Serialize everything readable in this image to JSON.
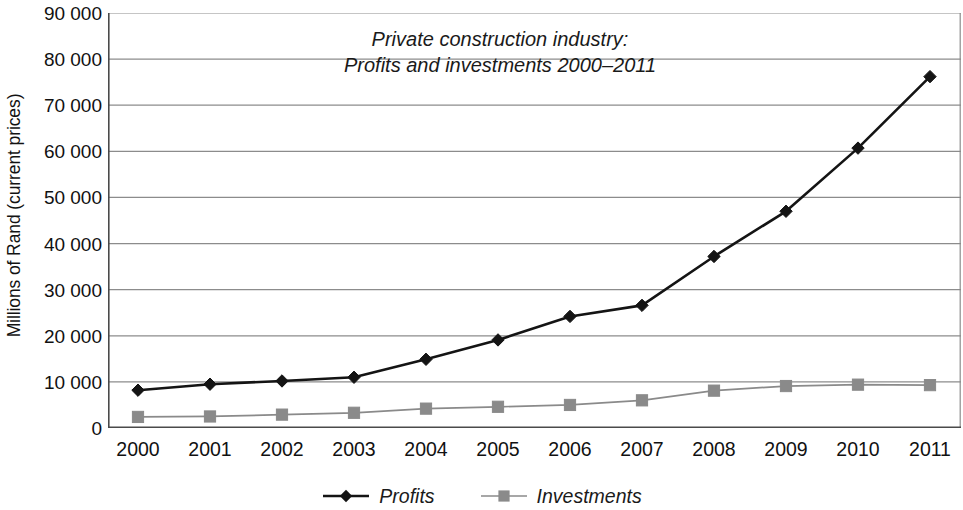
{
  "chart_data": {
    "type": "line",
    "title": "Private construction industry:\nProfits and investments 2000–2011",
    "title_line1": "Private construction industry:",
    "title_line2": "Profits and investments 2000–2011",
    "xlabel": "",
    "ylabel": "Millions of Rand (current prices)",
    "categories": [
      "2000",
      "2001",
      "2002",
      "2003",
      "2004",
      "2005",
      "2006",
      "2007",
      "2008",
      "2009",
      "2010",
      "2011"
    ],
    "x": [
      2000,
      2001,
      2002,
      2003,
      2004,
      2005,
      2006,
      2007,
      2008,
      2009,
      2010,
      2011
    ],
    "ylim": [
      0,
      90000
    ],
    "yticks": [
      "0",
      "10 000",
      "20 000",
      "30 000",
      "40 000",
      "50 000",
      "60 000",
      "70 000",
      "80 000",
      "90 000"
    ],
    "ytick_values": [
      0,
      10000,
      20000,
      30000,
      40000,
      50000,
      60000,
      70000,
      80000,
      90000
    ],
    "grid": true,
    "grid_axis": "y",
    "legend_position": "bottom-center",
    "series": [
      {
        "name": "Profits",
        "color": "#141414",
        "marker": "diamond",
        "values": [
          8200,
          9500,
          10200,
          11000,
          14900,
          19100,
          24200,
          26600,
          37200,
          47000,
          60700,
          76200
        ]
      },
      {
        "name": "Investments",
        "color": "#8a8a8a",
        "marker": "square",
        "values": [
          2400,
          2500,
          2900,
          3300,
          4200,
          4600,
          5000,
          6000,
          8100,
          9100,
          9400,
          9300
        ]
      }
    ]
  },
  "legend": {
    "items": [
      {
        "label": "Profits",
        "marker": "diamond",
        "color": "#141414"
      },
      {
        "label": "Investments",
        "marker": "square",
        "color": "#8a8a8a"
      }
    ]
  },
  "colors": {
    "profits": "#141414",
    "investments": "#8a8a8a",
    "grid": "#8c8c8c",
    "axis": "#4a4a4a",
    "background": "#ffffff"
  }
}
